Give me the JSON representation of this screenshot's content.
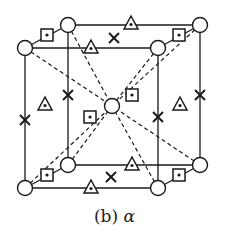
{
  "caption": {
    "label": "(b)",
    "phase": "α"
  },
  "colors": {
    "stroke": "#1a1a1a",
    "fill": "#ffffff"
  },
  "legend_semantics": {
    "circle": "atom-site-corner-and-body-center",
    "square": "interstitial-site-square",
    "triangle": "interstitial-site-triangle",
    "cross": "interstitial-site-cross"
  },
  "lattice": {
    "corners": {
      "front_top_left": [
        25,
        48
      ],
      "front_top_right": [
        158,
        48
      ],
      "front_bottom_left": [
        25,
        188
      ],
      "front_bottom_right": [
        158,
        188
      ],
      "back_top_left": [
        68,
        25
      ],
      "back_top_right": [
        200,
        25
      ],
      "back_bottom_left": [
        68,
        165
      ],
      "back_bottom_right": [
        200,
        165
      ]
    },
    "center": [
      112,
      106
    ]
  }
}
